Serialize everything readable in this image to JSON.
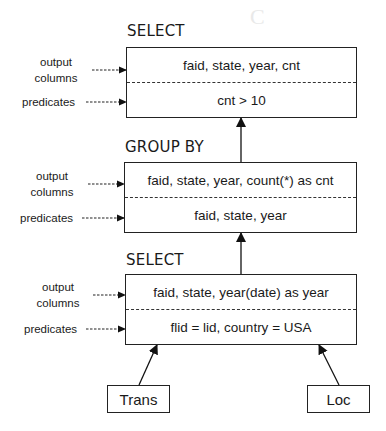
{
  "diagram": {
    "type": "query-plan",
    "direction": "bottom-to-top",
    "side_labels": {
      "output_columns": "output\ncolumns",
      "output_line1": "output",
      "output_line2": "columns",
      "predicates": "predicates"
    },
    "operators": [
      {
        "id": "select-top",
        "title": "SELECT",
        "output_columns": "faid, state, year, cnt",
        "predicates": "cnt > 10"
      },
      {
        "id": "group-by",
        "title": "GROUP BY",
        "output_columns": "faid, state, year, count(*) as cnt",
        "predicates": "faid, state, year"
      },
      {
        "id": "select-bottom",
        "title": "SELECT",
        "output_columns": "faid, state, year(date) as year",
        "predicates": "flid = lid, country = USA"
      }
    ],
    "relations": [
      {
        "id": "trans",
        "label": "Trans"
      },
      {
        "id": "loc",
        "label": "Loc"
      }
    ],
    "edges": [
      {
        "from": "trans",
        "to": "select-bottom"
      },
      {
        "from": "loc",
        "to": "select-bottom"
      },
      {
        "from": "select-bottom",
        "to": "group-by"
      },
      {
        "from": "group-by",
        "to": "select-top"
      }
    ]
  }
}
